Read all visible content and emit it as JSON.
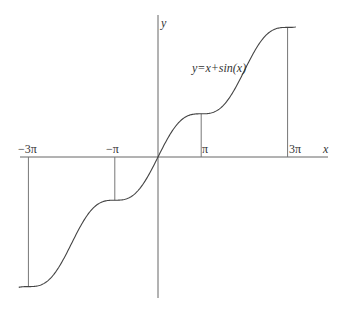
{
  "chart_data": {
    "type": "line",
    "title": "",
    "function_label": "y=x+sin(x)",
    "xlabel": "x",
    "ylabel": "y",
    "xlim": [
      -9.5,
      10.2
    ],
    "ylim": [
      -9.8,
      9.8
    ],
    "x_tick_labels": [
      "−3π",
      "−π",
      "π",
      "3π"
    ],
    "x_tick_values": [
      -9.4248,
      -3.1416,
      3.1416,
      9.4248
    ],
    "series": [
      {
        "name": "y=x+sin(x)",
        "x": [
          -9.4248,
          -6.2832,
          -3.1416,
          0,
          3.1416,
          6.2832,
          9.4248
        ],
        "values": [
          -9.4248,
          -6.2832,
          -3.1416,
          0,
          3.1416,
          6.2832,
          9.4248
        ]
      }
    ],
    "drop_lines": [
      -9.4248,
      -3.1416,
      3.1416,
      9.4248
    ],
    "grid": false,
    "legend": "none"
  }
}
